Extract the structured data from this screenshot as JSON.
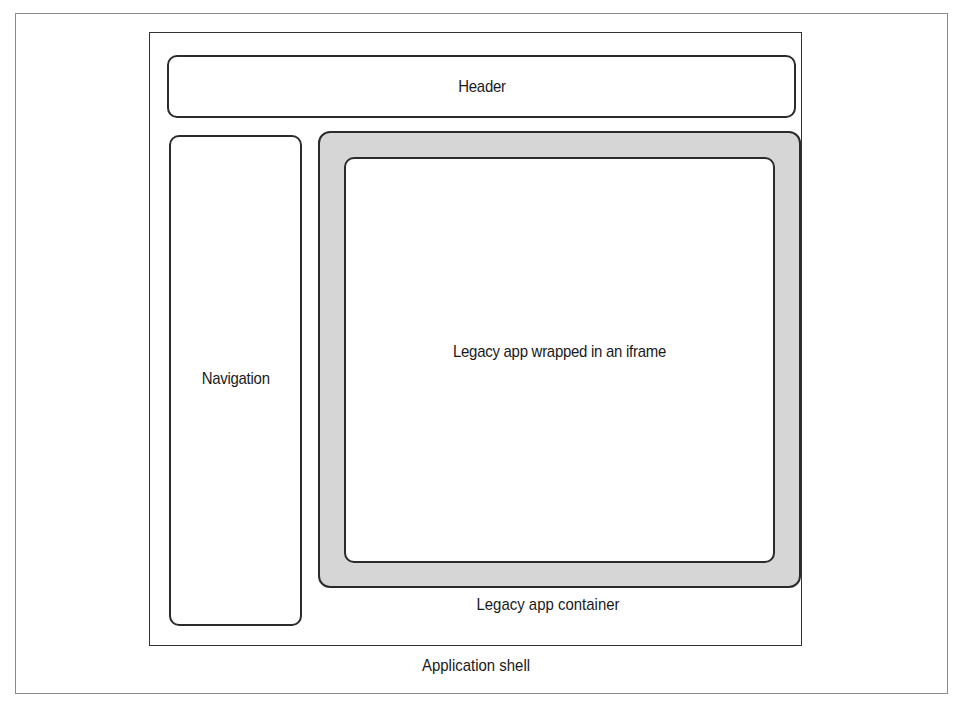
{
  "diagram": {
    "type": "nested-layout",
    "colors": {
      "frame_border": "#8a8a8a",
      "box_border": "#2b2b2b",
      "container_fill": "#d6d6d6",
      "background": "#ffffff"
    },
    "application_shell": {
      "label": "Application shell",
      "header": {
        "label": "Header"
      },
      "navigation": {
        "label": "Navigation"
      },
      "legacy_app_container": {
        "label": "Legacy app container",
        "iframe": {
          "label": "Legacy app wrapped in an iframe"
        }
      }
    }
  }
}
